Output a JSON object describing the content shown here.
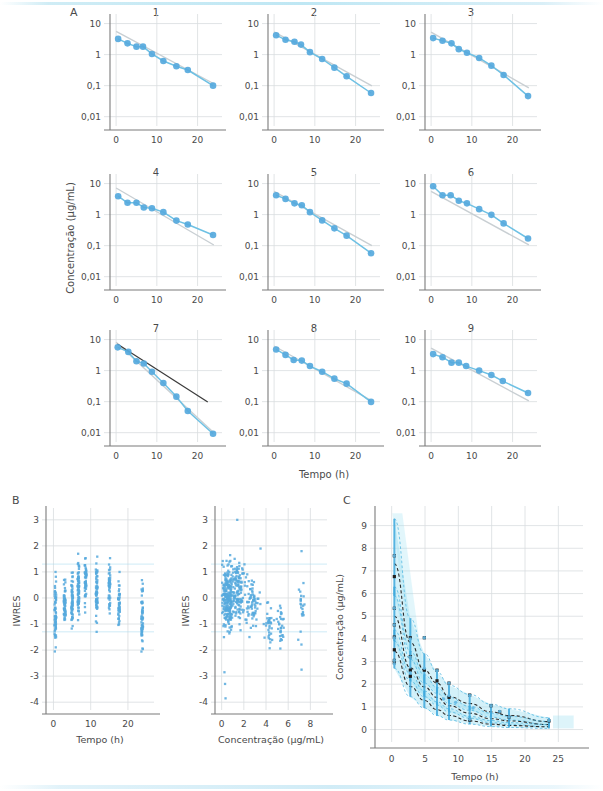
{
  "figure": {
    "panel_labels": {
      "a": "A",
      "b": "B",
      "c": "C"
    }
  },
  "colors": {
    "point": "#56a9dd",
    "point_light": "#7cc0e8",
    "line_blue": "#6ec1e4",
    "line_grey": "#c9cfd3",
    "line_dark": "#3a3a3a",
    "axis": "#7b7b7b",
    "grid": "#d9dde0",
    "band": "#9fe0f2",
    "text": "#4a4a4a"
  },
  "panelA": {
    "label": "A",
    "ylabel": "Concentração (µg/mL)",
    "xlabel": "Tempo (h)",
    "yticks": [
      "10",
      "1",
      "0,1",
      "0,01"
    ],
    "ytickvals": [
      10,
      1,
      0.1,
      0.01
    ],
    "xticks": [
      "0",
      "10",
      "20"
    ],
    "xtickvals": [
      0,
      10,
      20
    ],
    "xlim": [
      -1.5,
      26
    ],
    "ylim_log": [
      -2.3,
      1.05
    ],
    "subplots": [
      {
        "title": "1",
        "x": [
          0.5,
          2.8,
          5.0,
          6.6,
          8.8,
          11.6,
          14.8,
          17.6,
          23.8
        ],
        "y": [
          3.2,
          2.3,
          1.8,
          1.8,
          1.05,
          0.62,
          0.42,
          0.32,
          0.1
        ],
        "fit_blue": {
          "y0": 4.9,
          "y24": 0.105
        },
        "fit_grey": {
          "y0": 5.6,
          "y24": 0.115
        },
        "fit_dark": null
      },
      {
        "title": "2",
        "x": [
          0.5,
          2.8,
          5.0,
          6.6,
          8.8,
          11.8,
          14.8,
          17.8,
          23.8
        ],
        "y": [
          4.2,
          3.0,
          2.6,
          2.1,
          1.2,
          0.72,
          0.38,
          0.2,
          0.058
        ],
        "fit_blue": {
          "y0": 5.2,
          "y24": 0.06
        },
        "fit_grey": {
          "y0": 5.4,
          "y24": 0.098
        },
        "fit_dark": null
      },
      {
        "title": "3",
        "x": [
          0.5,
          2.8,
          5.0,
          6.8,
          8.8,
          11.8,
          14.8,
          17.8,
          23.8
        ],
        "y": [
          3.4,
          2.8,
          2.3,
          1.5,
          1.15,
          0.78,
          0.44,
          0.22,
          0.046
        ],
        "fit_blue": {
          "y0": 4.6,
          "y24": 0.07
        },
        "fit_grey": {
          "y0": 5.3,
          "y24": 0.085
        },
        "fit_dark": null
      },
      {
        "title": "4",
        "x": [
          0.5,
          2.8,
          5.0,
          6.8,
          8.8,
          11.6,
          14.8,
          17.6,
          23.8
        ],
        "y": [
          3.9,
          2.4,
          2.4,
          1.7,
          1.6,
          1.2,
          0.64,
          0.48,
          0.22
        ],
        "fit_blue": {
          "y0": 4.3,
          "y24": 0.215
        },
        "fit_grey": {
          "y0": 7.2,
          "y24": 0.105
        },
        "fit_dark": null
      },
      {
        "title": "5",
        "x": [
          0.5,
          2.8,
          5.0,
          6.8,
          8.8,
          11.8,
          14.8,
          17.8,
          23.8
        ],
        "y": [
          4.2,
          3.2,
          2.3,
          2.0,
          1.2,
          0.65,
          0.36,
          0.21,
          0.057
        ],
        "fit_blue": {
          "y0": 5.5,
          "y24": 0.06
        },
        "fit_grey": {
          "y0": 5.6,
          "y24": 0.1
        },
        "fit_dark": null
      },
      {
        "title": "6",
        "x": [
          0.5,
          2.8,
          4.8,
          6.8,
          8.8,
          11.8,
          14.8,
          17.8,
          23.8
        ],
        "y": [
          8.2,
          4.2,
          4.2,
          2.8,
          2.3,
          1.5,
          0.98,
          0.52,
          0.17
        ],
        "fit_blue": {
          "y0": 8.6,
          "y24": 0.175
        },
        "fit_grey": {
          "y0": 5.6,
          "y24": 0.105
        },
        "fit_dark": null
      },
      {
        "title": "7",
        "x": [
          0.4,
          3.0,
          5.0,
          6.8,
          8.8,
          11.6,
          14.8,
          17.6,
          23.8
        ],
        "y": [
          5.6,
          4.0,
          2.0,
          1.7,
          0.92,
          0.4,
          0.145,
          0.05,
          0.0092
        ],
        "fit_blue": {
          "y0": 8.0,
          "y24": 0.0092
        },
        "fit_grey": {
          "y0": 8.2,
          "y24": 0.01
        },
        "fit_dark": {
          "x0": 0.3,
          "y0": 7.2,
          "x1": 22.5,
          "y1": 0.098
        }
      },
      {
        "title": "8",
        "x": [
          0.5,
          2.8,
          4.8,
          6.8,
          8.8,
          11.8,
          14.8,
          17.8,
          23.8
        ],
        "y": [
          4.8,
          3.2,
          2.2,
          2.1,
          1.4,
          0.92,
          0.55,
          0.38,
          0.098
        ],
        "fit_blue": {
          "y0": 6.0,
          "y24": 0.098
        },
        "fit_grey": {
          "y0": 6.2,
          "y24": 0.105
        },
        "fit_dark": null
      },
      {
        "title": "9",
        "x": [
          0.5,
          2.8,
          5.0,
          6.8,
          8.6,
          11.8,
          14.8,
          17.6,
          23.8
        ],
        "y": [
          3.4,
          2.7,
          1.8,
          1.8,
          1.4,
          1.0,
          0.72,
          0.46,
          0.19
        ],
        "fit_blue": {
          "y0": 4.0,
          "y24": 0.185
        },
        "fit_grey": {
          "y0": 5.3,
          "y24": 0.105
        },
        "fit_dark": null
      }
    ]
  },
  "panelB": {
    "label": "B",
    "left": {
      "ylabel": "IWRES",
      "xlabel": "Tempo (h)",
      "yticks": [
        "3",
        "2",
        "1",
        "0",
        "-1",
        "-2",
        "-3",
        "-4"
      ],
      "ytickvals": [
        3,
        2,
        1,
        0,
        -1,
        -2,
        -3,
        -4
      ],
      "xticks": [
        "0",
        "10",
        "20"
      ],
      "xtickvals": [
        0,
        10,
        20
      ],
      "xlim": [
        -2,
        27
      ],
      "ylim": [
        -4.3,
        3.3
      ],
      "stripes": [
        {
          "t": 0.5,
          "n": 62,
          "mean": -0.45,
          "sd": 1.05,
          "min": -2.75,
          "max": 1.8
        },
        {
          "t": 3.0,
          "n": 54,
          "mean": -0.25,
          "sd": 0.8,
          "min": -1.7,
          "max": 1.3
        },
        {
          "t": 5.0,
          "n": 58,
          "mean": 0.0,
          "sd": 0.9,
          "min": -1.95,
          "max": 1.95
        },
        {
          "t": 6.7,
          "n": 66,
          "mean": 0.35,
          "sd": 0.95,
          "min": -1.6,
          "max": 3.0
        },
        {
          "t": 8.6,
          "n": 50,
          "mean": 0.55,
          "sd": 0.75,
          "min": -0.75,
          "max": 1.75
        },
        {
          "t": 11.6,
          "n": 64,
          "mean": 0.3,
          "sd": 1.0,
          "min": -1.9,
          "max": 2.45
        },
        {
          "t": 15.0,
          "n": 46,
          "mean": 0.35,
          "sd": 0.8,
          "min": -1.2,
          "max": 1.8
        },
        {
          "t": 17.6,
          "n": 44,
          "mean": -0.25,
          "sd": 0.85,
          "min": -1.95,
          "max": 1.1
        },
        {
          "t": 23.8,
          "n": 56,
          "mean": -0.85,
          "sd": 1.1,
          "min": -3.8,
          "max": 0.85
        }
      ]
    },
    "right": {
      "ylabel": "IWRES",
      "xlabel": "Concentração (µg/mL)",
      "yticks": [
        "3",
        "2",
        "1",
        "0",
        "-1",
        "-2",
        "-3",
        "-4"
      ],
      "ytickvals": [
        3,
        2,
        1,
        0,
        -1,
        -2,
        -3,
        -4
      ],
      "xticks": [
        "0",
        "2",
        "4",
        "6",
        "8"
      ],
      "xtickvals": [
        0,
        2,
        4,
        6,
        8
      ],
      "xlim": [
        -0.6,
        9.5
      ],
      "ylim": [
        -4.3,
        3.3
      ],
      "clusters": [
        {
          "cx": 0.55,
          "cy": 0.05,
          "n": 230,
          "sx": 0.45,
          "sy": 1.05
        },
        {
          "cx": 1.5,
          "cy": 0.25,
          "n": 120,
          "sx": 0.55,
          "sy": 0.95
        },
        {
          "cx": 2.8,
          "cy": -0.35,
          "n": 70,
          "sx": 0.6,
          "sy": 0.85
        },
        {
          "cx": 4.3,
          "cy": -0.95,
          "n": 34,
          "sx": 0.35,
          "sy": 0.8
        },
        {
          "cx": 5.3,
          "cy": -0.95,
          "n": 30,
          "sx": 0.3,
          "sy": 0.85
        },
        {
          "cx": 7.2,
          "cy": -0.55,
          "n": 22,
          "sx": 0.22,
          "sy": 1.15
        }
      ]
    }
  },
  "panelC": {
    "label": "C",
    "ylabel": "Concentração (µg/mL)",
    "xlabel": "Tempo (h)",
    "yticks": [
      "0",
      "1",
      "2",
      "3",
      "4",
      "5",
      "6",
      "7",
      "8",
      "9"
    ],
    "ytickvals": [
      0,
      1,
      2,
      3,
      4,
      5,
      6,
      7,
      8,
      9
    ],
    "xticks": [
      "0",
      "5",
      "10",
      "15",
      "20",
      "25"
    ],
    "xtickvals": [
      0,
      5,
      10,
      15,
      20,
      25
    ],
    "xlim": [
      -2.5,
      27.5
    ],
    "ylim": [
      -0.55,
      9.6
    ],
    "times": [
      0.4,
      2.8,
      4.9,
      6.8,
      8.6,
      11.7,
      14.9,
      17.6,
      23.6
    ],
    "curves": [
      {
        "name": "percentil-95",
        "values": [
          7.32,
          3.85,
          2.62,
          2.05,
          1.45,
          1.15,
          0.78,
          0.62,
          0.35
        ],
        "band_upper": [
          9.3,
          4.9,
          3.35,
          2.55,
          1.95,
          1.55,
          1.12,
          0.92,
          0.52
        ],
        "band_lower": [
          5.9,
          3.1,
          2.05,
          1.6,
          1.15,
          0.85,
          0.55,
          0.42,
          0.22
        ]
      },
      {
        "name": "mediana",
        "values": [
          5.0,
          2.72,
          1.88,
          1.42,
          1.05,
          0.72,
          0.48,
          0.38,
          0.22
        ],
        "band_upper": [
          6.3,
          3.45,
          2.42,
          1.85,
          1.42,
          1.02,
          0.72,
          0.58,
          0.36
        ],
        "band_lower": [
          3.9,
          2.15,
          1.45,
          1.08,
          0.78,
          0.5,
          0.3,
          0.22,
          0.12
        ]
      },
      {
        "name": "percentil-5",
        "values": [
          3.45,
          1.9,
          1.28,
          0.88,
          0.62,
          0.38,
          0.24,
          0.18,
          0.12
        ],
        "band_upper": [
          4.4,
          2.45,
          1.7,
          1.22,
          0.92,
          0.58,
          0.4,
          0.3,
          0.22
        ],
        "band_lower": [
          2.7,
          1.45,
          0.95,
          0.62,
          0.42,
          0.24,
          0.13,
          0.09,
          0.05
        ]
      }
    ],
    "observed_markers": [
      {
        "t": 0.4,
        "v": 7.67
      },
      {
        "t": 0.4,
        "v": 6.75
      },
      {
        "t": 0.4,
        "v": 5.35
      },
      {
        "t": 0.4,
        "v": 4.62
      },
      {
        "t": 0.4,
        "v": 4.08
      },
      {
        "t": 0.4,
        "v": 3.52
      },
      {
        "t": 0.4,
        "v": 3.05
      },
      {
        "t": 0.4,
        "v": 2.95
      },
      {
        "t": 2.8,
        "v": 4.05
      },
      {
        "t": 2.8,
        "v": 3.22
      },
      {
        "t": 2.8,
        "v": 2.62
      },
      {
        "t": 2.8,
        "v": 2.35
      },
      {
        "t": 4.9,
        "v": 4.05
      },
      {
        "t": 4.9,
        "v": 2.62
      },
      {
        "t": 6.8,
        "v": 2.62
      },
      {
        "t": 6.8,
        "v": 2.15
      },
      {
        "t": 8.6,
        "v": 2.05
      },
      {
        "t": 8.6,
        "v": 1.42
      },
      {
        "t": 11.7,
        "v": 1.52
      },
      {
        "t": 11.7,
        "v": 0.42
      },
      {
        "t": 14.9,
        "v": 1.05
      },
      {
        "t": 16.2,
        "v": 0.78
      },
      {
        "t": 17.6,
        "v": 0.55
      },
      {
        "t": 23.6,
        "v": 0.38
      }
    ]
  }
}
